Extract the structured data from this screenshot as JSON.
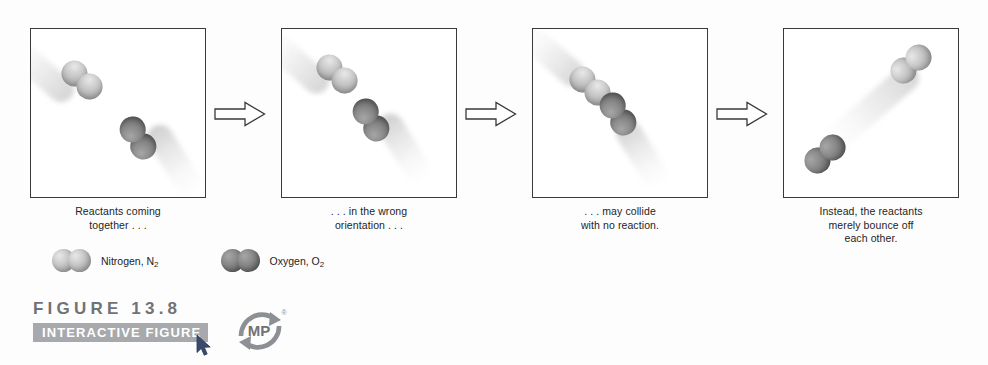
{
  "figure": {
    "number_label": "FIGURE 13.8",
    "interactive_label": "INTERACTIVE FIGURE",
    "logo_text": "MP",
    "logo_trademark": "®"
  },
  "panels": [
    {
      "caption_line1": "Reactants coming",
      "caption_line2": "together . . .",
      "caption_line3": ""
    },
    {
      "caption_line1": ". . . in the wrong",
      "caption_line2": "orientation . . .",
      "caption_line3": ""
    },
    {
      "caption_line1": ". . . may collide",
      "caption_line2": "with no reaction.",
      "caption_line3": ""
    },
    {
      "caption_line1": "Instead, the reactants",
      "caption_line2": "merely bounce off",
      "caption_line3": "each other."
    }
  ],
  "legend": [
    {
      "name": "Nitrogen, N",
      "subscript": "2",
      "species": "nitrogen",
      "color": "#b8b8b8"
    },
    {
      "name": "Oxygen, O",
      "subscript": "2",
      "species": "oxygen",
      "color": "#7a7a7a"
    }
  ],
  "arrows": [
    {
      "direction": "right"
    },
    {
      "direction": "right"
    },
    {
      "direction": "right"
    }
  ],
  "colors": {
    "panel_border": "#3a3a3a",
    "banner_background": "#a7a9ac",
    "figure_number_text": "#6f7377",
    "logo_gray": "#8c8f93",
    "background": "#fdfdfd"
  }
}
